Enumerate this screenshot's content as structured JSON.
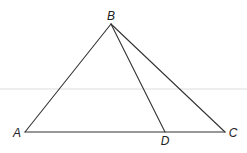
{
  "diagram": {
    "type": "geometry-triangle",
    "line_color": "#333333",
    "points": {
      "A": {
        "label": "A",
        "x": 25,
        "y": 132
      },
      "B": {
        "label": "B",
        "x": 111,
        "y": 24
      },
      "C": {
        "label": "C",
        "x": 225,
        "y": 132
      },
      "D": {
        "label": "D",
        "x": 165,
        "y": 132
      }
    },
    "segments": [
      {
        "from": "A",
        "to": "B"
      },
      {
        "from": "B",
        "to": "C"
      },
      {
        "from": "A",
        "to": "C"
      },
      {
        "from": "B",
        "to": "D"
      }
    ],
    "labels": {
      "A": "A",
      "B": "B",
      "C": "C",
      "D": "D"
    }
  }
}
